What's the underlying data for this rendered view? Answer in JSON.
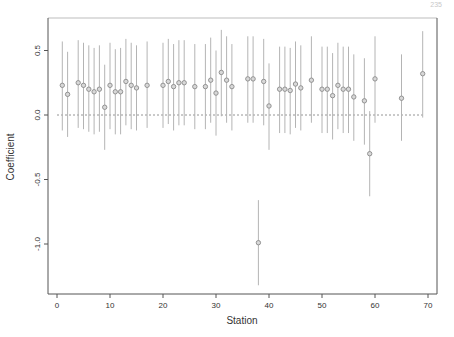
{
  "page": {
    "number": "235"
  },
  "chart_data": {
    "type": "scatter",
    "subtype": "point-with-error-bars",
    "title": "",
    "xlabel": "Station",
    "ylabel": "Coefficient",
    "xlim": [
      -2,
      72
    ],
    "ylim": [
      -1.37,
      0.76
    ],
    "xticks": [
      0,
      10,
      20,
      30,
      40,
      50,
      60,
      70
    ],
    "xtick_labels": [
      "0",
      "10",
      "20",
      "30",
      "40",
      "50",
      "60",
      "70"
    ],
    "yticks": [
      -1.0,
      -0.5,
      0.0,
      0.5
    ],
    "ytick_labels": [
      "-1.0",
      "-0.5",
      "0.0",
      "0.5"
    ],
    "grid": false,
    "legend": null,
    "reference_line": {
      "y": 0,
      "style": "dashed",
      "x_from": 0,
      "x_to": 69
    },
    "colors": {
      "point": "#8a8a8a",
      "bar": "#b4b4b4",
      "axis": "#555555",
      "refline": "#7a7a7a"
    },
    "points": [
      {
        "x": 1,
        "y": 0.23,
        "lo": -0.12,
        "hi": 0.57
      },
      {
        "x": 2,
        "y": 0.16,
        "lo": -0.17,
        "hi": 0.49
      },
      {
        "x": 4,
        "y": 0.25,
        "lo": -0.1,
        "hi": 0.58
      },
      {
        "x": 5,
        "y": 0.23,
        "lo": -0.11,
        "hi": 0.56
      },
      {
        "x": 6,
        "y": 0.2,
        "lo": -0.13,
        "hi": 0.54
      },
      {
        "x": 7,
        "y": 0.18,
        "lo": -0.15,
        "hi": 0.52
      },
      {
        "x": 8,
        "y": 0.2,
        "lo": -0.13,
        "hi": 0.54
      },
      {
        "x": 9,
        "y": 0.06,
        "lo": -0.27,
        "hi": 0.39
      },
      {
        "x": 10,
        "y": 0.23,
        "lo": -0.11,
        "hi": 0.56
      },
      {
        "x": 11,
        "y": 0.18,
        "lo": -0.15,
        "hi": 0.51
      },
      {
        "x": 12,
        "y": 0.18,
        "lo": -0.15,
        "hi": 0.52
      },
      {
        "x": 13,
        "y": 0.26,
        "lo": -0.08,
        "hi": 0.59
      },
      {
        "x": 14,
        "y": 0.23,
        "lo": -0.11,
        "hi": 0.56
      },
      {
        "x": 15,
        "y": 0.21,
        "lo": -0.12,
        "hi": 0.54
      },
      {
        "x": 17,
        "y": 0.23,
        "lo": -0.1,
        "hi": 0.57
      },
      {
        "x": 20,
        "y": 0.23,
        "lo": -0.1,
        "hi": 0.56
      },
      {
        "x": 21,
        "y": 0.26,
        "lo": -0.07,
        "hi": 0.59
      },
      {
        "x": 22,
        "y": 0.22,
        "lo": -0.12,
        "hi": 0.55
      },
      {
        "x": 23,
        "y": 0.25,
        "lo": -0.08,
        "hi": 0.58
      },
      {
        "x": 24,
        "y": 0.25,
        "lo": -0.08,
        "hi": 0.58
      },
      {
        "x": 26,
        "y": 0.22,
        "lo": -0.11,
        "hi": 0.55
      },
      {
        "x": 28,
        "y": 0.22,
        "lo": -0.11,
        "hi": 0.55
      },
      {
        "x": 29,
        "y": 0.27,
        "lo": -0.06,
        "hi": 0.6
      },
      {
        "x": 30,
        "y": 0.17,
        "lo": -0.16,
        "hi": 0.5
      },
      {
        "x": 31,
        "y": 0.33,
        "lo": -0.01,
        "hi": 0.66
      },
      {
        "x": 32,
        "y": 0.27,
        "lo": -0.06,
        "hi": 0.61
      },
      {
        "x": 33,
        "y": 0.22,
        "lo": -0.12,
        "hi": 0.55
      },
      {
        "x": 36,
        "y": 0.28,
        "lo": -0.06,
        "hi": 0.61
      },
      {
        "x": 37,
        "y": 0.28,
        "lo": -0.06,
        "hi": 0.61
      },
      {
        "x": 38,
        "y": -0.99,
        "lo": -1.32,
        "hi": -0.66
      },
      {
        "x": 39,
        "y": 0.26,
        "lo": -0.08,
        "hi": 0.59
      },
      {
        "x": 40,
        "y": 0.07,
        "lo": -0.27,
        "hi": 0.4
      },
      {
        "x": 42,
        "y": 0.2,
        "lo": -0.14,
        "hi": 0.53
      },
      {
        "x": 43,
        "y": 0.2,
        "lo": -0.14,
        "hi": 0.53
      },
      {
        "x": 44,
        "y": 0.19,
        "lo": -0.15,
        "hi": 0.52
      },
      {
        "x": 45,
        "y": 0.24,
        "lo": -0.1,
        "hi": 0.57
      },
      {
        "x": 46,
        "y": 0.21,
        "lo": -0.12,
        "hi": 0.54
      },
      {
        "x": 48,
        "y": 0.27,
        "lo": -0.06,
        "hi": 0.61
      },
      {
        "x": 50,
        "y": 0.2,
        "lo": -0.14,
        "hi": 0.53
      },
      {
        "x": 51,
        "y": 0.2,
        "lo": -0.14,
        "hi": 0.53
      },
      {
        "x": 52,
        "y": 0.15,
        "lo": -0.19,
        "hi": 0.48
      },
      {
        "x": 53,
        "y": 0.23,
        "lo": -0.11,
        "hi": 0.56
      },
      {
        "x": 54,
        "y": 0.2,
        "lo": -0.14,
        "hi": 0.53
      },
      {
        "x": 55,
        "y": 0.2,
        "lo": -0.14,
        "hi": 0.53
      },
      {
        "x": 56,
        "y": 0.14,
        "lo": -0.2,
        "hi": 0.47
      },
      {
        "x": 58,
        "y": 0.11,
        "lo": -0.23,
        "hi": 0.44
      },
      {
        "x": 59,
        "y": -0.3,
        "lo": -0.63,
        "hi": 0.03
      },
      {
        "x": 60,
        "y": 0.28,
        "lo": -0.06,
        "hi": 0.61
      },
      {
        "x": 65,
        "y": 0.13,
        "lo": -0.2,
        "hi": 0.47
      },
      {
        "x": 69,
        "y": 0.32,
        "lo": -0.02,
        "hi": 0.65
      }
    ]
  }
}
